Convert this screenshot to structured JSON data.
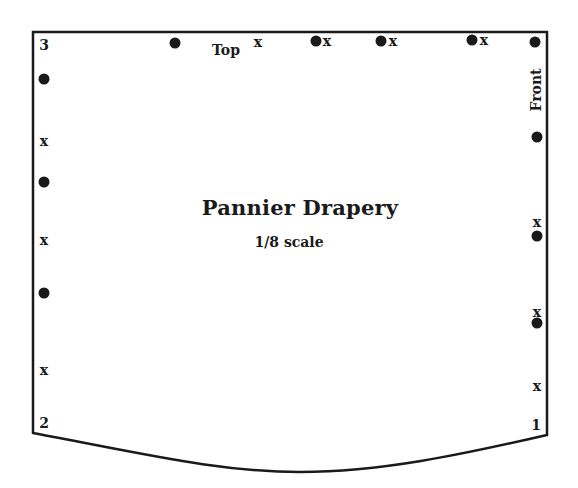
{
  "title": "Pannier Drapery",
  "subtitle": "1/8 scale",
  "edge_labels": {
    "top": "Top",
    "front": "Front"
  },
  "corners": [
    {
      "label": "3",
      "x": 44,
      "y": 45
    },
    {
      "label": "2",
      "x": 44,
      "y": 423
    },
    {
      "label": "1",
      "x": 536,
      "y": 425
    }
  ],
  "marker_glyph": "x",
  "outline": {
    "stroke": "#1a1a1a",
    "path": "M33 32 L547 32 L547 435 C 460 455, 380 472, 300 472 C 220 472, 150 455, 33 433 Z"
  },
  "dots": [
    {
      "x": 175,
      "y": 43
    },
    {
      "x": 316,
      "y": 41
    },
    {
      "x": 381,
      "y": 41
    },
    {
      "x": 472,
      "y": 40
    },
    {
      "x": 535,
      "y": 42
    },
    {
      "x": 44,
      "y": 79
    },
    {
      "x": 44,
      "y": 182
    },
    {
      "x": 44,
      "y": 293
    },
    {
      "x": 537,
      "y": 137
    },
    {
      "x": 537,
      "y": 236
    },
    {
      "x": 537,
      "y": 323
    }
  ],
  "x_marks": [
    {
      "x": 258,
      "y": 42
    },
    {
      "x": 327,
      "y": 41
    },
    {
      "x": 393,
      "y": 41
    },
    {
      "x": 484,
      "y": 40
    },
    {
      "x": 44,
      "y": 141
    },
    {
      "x": 44,
      "y": 240
    },
    {
      "x": 44,
      "y": 370
    },
    {
      "x": 537,
      "y": 222
    },
    {
      "x": 537,
      "y": 312
    },
    {
      "x": 537,
      "y": 386
    }
  ]
}
